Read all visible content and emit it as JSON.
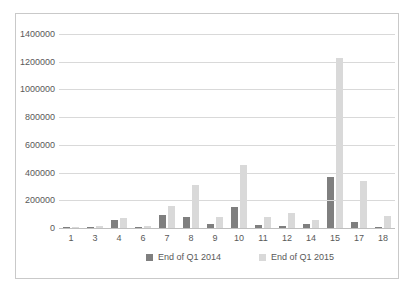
{
  "chart_data": {
    "type": "bar",
    "title": "",
    "xlabel": "",
    "ylabel": "",
    "categories": [
      "1",
      "3",
      "4",
      "6",
      "7",
      "8",
      "9",
      "10",
      "11",
      "12",
      "14",
      "15",
      "17",
      "18"
    ],
    "series": [
      {
        "name": "End of Q1 2014",
        "color": "#7f7f7f",
        "values": [
          3000,
          6000,
          60000,
          4000,
          95000,
          82000,
          30000,
          155000,
          25000,
          18000,
          30000,
          365000,
          40000,
          8000
        ]
      },
      {
        "name": "End of Q1 2015",
        "color": "#d9d9d9",
        "values": [
          5000,
          13000,
          72000,
          14000,
          160000,
          310000,
          80000,
          455000,
          80000,
          110000,
          55000,
          1230000,
          340000,
          85000
        ]
      }
    ],
    "ylim": [
      0,
      1400000
    ],
    "ytick_step": 200000,
    "ytick_labels": [
      "0",
      "200000",
      "400000",
      "600000",
      "800000",
      "1000000",
      "1200000",
      "1400000"
    ],
    "grid": true,
    "legend_position": "bottom"
  },
  "colors": {
    "gridline": "#d9d9d9",
    "axis_line": "#bfbfbf",
    "frame_border": "#c9c9c9",
    "text": "#595959",
    "background": "#ffffff"
  }
}
